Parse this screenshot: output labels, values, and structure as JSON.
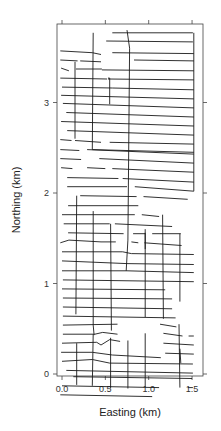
{
  "chart_data": {
    "type": "line",
    "title": "",
    "xlabel": "Easting (km)",
    "ylabel": "Northing (km)",
    "xlim": [
      -0.06,
      1.62
    ],
    "ylim": [
      -0.02,
      3.87
    ],
    "xticks": [
      0.0,
      0.5,
      1.0,
      1.5
    ],
    "xtick_labels": [
      "0.0",
      "0.5",
      "1.0",
      "1.5"
    ],
    "yticks": [
      0,
      1,
      2,
      3
    ],
    "ytick_labels": [
      "0",
      "1",
      "2",
      "3"
    ],
    "grid": false,
    "legend": null,
    "line_color": "#1a1a1a",
    "series": [
      {
        "name": "EW lines",
        "segments": [
          [
            [
              0.58,
              3.77
            ],
            [
              1.51,
              3.77
            ]
          ],
          [
            [
              0.51,
              3.68
            ],
            [
              1.51,
              3.67
            ]
          ],
          [
            [
              -0.02,
              3.57
            ],
            [
              0.35,
              3.55
            ],
            [
              0.45,
              3.53
            ]
          ],
          [
            [
              0.58,
              3.55
            ],
            [
              1.52,
              3.54
            ]
          ],
          [
            [
              -0.02,
              3.47
            ],
            [
              0.18,
              3.46
            ]
          ],
          [
            [
              0.21,
              3.46
            ],
            [
              0.45,
              3.45
            ]
          ],
          [
            [
              0.83,
              3.47
            ],
            [
              1.52,
              3.46
            ]
          ],
          [
            [
              -0.01,
              3.38
            ],
            [
              0.08,
              3.35
            ]
          ],
          [
            [
              0.16,
              3.37
            ],
            [
              0.46,
              3.37
            ]
          ],
          [
            [
              0.46,
              3.36
            ],
            [
              1.52,
              3.35
            ]
          ],
          [
            [
              -0.02,
              3.27
            ],
            [
              0.52,
              3.26
            ]
          ],
          [
            [
              0.53,
              3.26
            ],
            [
              1.52,
              3.25
            ]
          ],
          [
            [
              0.0,
              3.17
            ],
            [
              0.58,
              3.16
            ],
            [
              1.52,
              3.14
            ]
          ],
          [
            [
              -0.01,
              3.08
            ],
            [
              1.52,
              3.04
            ]
          ],
          [
            [
              0.01,
              2.99
            ],
            [
              1.52,
              2.94
            ]
          ],
          [
            [
              0.05,
              2.89
            ],
            [
              1.52,
              2.84
            ]
          ],
          [
            [
              -0.01,
              2.79
            ],
            [
              1.52,
              2.74
            ]
          ],
          [
            [
              0.06,
              2.69
            ],
            [
              1.52,
              2.64
            ]
          ],
          [
            [
              -0.02,
              2.59
            ],
            [
              0.11,
              2.58
            ]
          ],
          [
            [
              0.15,
              2.58
            ],
            [
              0.45,
              2.56
            ]
          ],
          [
            [
              0.55,
              2.56
            ],
            [
              1.52,
              2.54
            ]
          ],
          [
            [
              -0.02,
              2.48
            ],
            [
              0.2,
              2.47
            ]
          ],
          [
            [
              0.29,
              2.48
            ],
            [
              1.52,
              2.43
            ]
          ],
          [
            [
              -0.02,
              2.38
            ],
            [
              0.22,
              2.37
            ]
          ],
          [
            [
              0.43,
              2.38
            ],
            [
              1.52,
              2.33
            ]
          ],
          [
            [
              -0.01,
              2.28
            ],
            [
              0.12,
              2.27
            ]
          ],
          [
            [
              0.29,
              2.28
            ],
            [
              0.5,
              2.27
            ]
          ],
          [
            [
              0.58,
              2.27
            ],
            [
              1.52,
              2.23
            ]
          ],
          [
            [
              0.06,
              2.17
            ],
            [
              0.65,
              2.16
            ]
          ],
          [
            [
              0.7,
              2.16
            ],
            [
              1.52,
              2.12
            ]
          ],
          [
            [
              0.06,
              2.07
            ],
            [
              0.75,
              2.07
            ]
          ],
          [
            [
              0.84,
              2.07
            ],
            [
              1.52,
              2.02
            ]
          ],
          [
            [
              0.21,
              1.97
            ],
            [
              0.86,
              1.96
            ]
          ],
          [
            [
              0.94,
              1.96
            ],
            [
              1.45,
              1.93
            ]
          ],
          [
            [
              0.07,
              1.86
            ],
            [
              0.88,
              1.86
            ]
          ],
          [
            [
              0.0,
              1.76
            ],
            [
              0.84,
              1.76
            ]
          ],
          [
            [
              0.92,
              1.76
            ],
            [
              1.12,
              1.74
            ]
          ],
          [
            [
              0.02,
              1.66
            ],
            [
              0.55,
              1.66
            ]
          ],
          [
            [
              0.61,
              1.66
            ],
            [
              1.27,
              1.63
            ]
          ],
          [
            [
              0.07,
              1.56
            ],
            [
              0.71,
              1.55
            ]
          ],
          [
            [
              0.82,
              1.55
            ],
            [
              0.96,
              1.55
            ]
          ],
          [
            [
              1.04,
              1.55
            ],
            [
              1.37,
              1.55
            ]
          ],
          [
            [
              -0.02,
              1.45
            ],
            [
              0.08,
              1.48
            ],
            [
              0.45,
              1.46
            ],
            [
              0.62,
              1.46
            ]
          ],
          [
            [
              0.8,
              1.46
            ],
            [
              0.88,
              1.45
            ]
          ],
          [
            [
              0.95,
              1.45
            ],
            [
              1.38,
              1.42
            ]
          ],
          [
            [
              0.0,
              1.35
            ],
            [
              0.7,
              1.35
            ],
            [
              0.8,
              1.33
            ],
            [
              1.52,
              1.32
            ]
          ],
          [
            [
              0.0,
              1.25
            ],
            [
              0.75,
              1.22
            ],
            [
              1.52,
              1.21
            ]
          ],
          [
            [
              0.0,
              1.14
            ],
            [
              0.75,
              1.14
            ],
            [
              1.52,
              1.12
            ]
          ],
          [
            [
              0.01,
              1.04
            ],
            [
              1.52,
              1.02
            ]
          ],
          [
            [
              0.0,
              0.94
            ],
            [
              1.19,
              0.93
            ]
          ],
          [
            [
              0.01,
              0.84
            ],
            [
              1.27,
              0.83
            ]
          ],
          [
            [
              0.01,
              0.74
            ],
            [
              1.27,
              0.72
            ]
          ],
          [
            [
              0.01,
              0.64
            ],
            [
              1.31,
              0.62
            ]
          ],
          [
            [
              0.01,
              0.54
            ],
            [
              0.64,
              0.55
            ]
          ],
          [
            [
              1.13,
              0.55
            ],
            [
              1.32,
              0.52
            ]
          ],
          [
            [
              0.01,
              0.44
            ],
            [
              0.38,
              0.44
            ],
            [
              0.47,
              0.46
            ],
            [
              0.64,
              0.44
            ]
          ],
          [
            [
              1.17,
              0.45
            ],
            [
              1.39,
              0.42
            ]
          ],
          [
            [
              1.46,
              0.42
            ],
            [
              1.52,
              0.42
            ]
          ],
          [
            [
              0.0,
              0.34
            ],
            [
              0.4,
              0.35
            ],
            [
              0.45,
              0.32
            ],
            [
              0.55,
              0.38
            ],
            [
              0.67,
              0.36
            ]
          ],
          [
            [
              1.17,
              0.34
            ],
            [
              1.52,
              0.32
            ]
          ],
          [
            [
              -0.01,
              0.24
            ],
            [
              0.35,
              0.24
            ],
            [
              0.58,
              0.21
            ],
            [
              1.14,
              0.18
            ]
          ],
          [
            [
              1.19,
              0.23
            ],
            [
              1.52,
              0.22
            ]
          ],
          [
            [
              0.0,
              0.14
            ],
            [
              0.35,
              0.16
            ],
            [
              0.55,
              0.12
            ],
            [
              1.51,
              0.11
            ]
          ],
          [
            [
              0.05,
              0.04
            ],
            [
              1.51,
              0.01
            ]
          ],
          [
            [
              0.13,
              -0.03
            ],
            [
              1.5,
              -0.05
            ]
          ],
          [
            [
              0.0,
              -0.13
            ],
            [
              1.12,
              -0.15
            ]
          ],
          [
            [
              1.45,
              -0.15
            ],
            [
              1.51,
              -0.15
            ]
          ],
          [
            [
              -0.02,
              -0.23
            ],
            [
              1.04,
              -0.25
            ]
          ]
        ]
      },
      {
        "name": "NS tie lines",
        "segments": [
          [
            [
              0.36,
              3.77
            ],
            [
              0.35,
              2.48
            ]
          ],
          [
            [
              0.75,
              3.8
            ],
            [
              0.78,
              3.6
            ],
            [
              0.76,
              1.48
            ],
            [
              0.74,
              1.14
            ]
          ],
          [
            [
              0.15,
              3.45
            ],
            [
              0.15,
              2.6
            ]
          ],
          [
            [
              0.53,
              3.27
            ],
            [
              0.55,
              3.27
            ],
            [
              0.55,
              2.98
            ]
          ],
          [
            [
              0.35,
              2.48
            ],
            [
              1.52,
              2.45
            ]
          ],
          [
            [
              1.52,
              3.77
            ],
            [
              1.52,
              2.02
            ]
          ],
          [
            [
              0.17,
              1.97
            ],
            [
              0.16,
              0.66
            ]
          ],
          [
            [
              0.36,
              1.8
            ],
            [
              0.36,
              0.54
            ],
            [
              0.37,
              0.43
            ]
          ],
          [
            [
              0.56,
              1.66
            ],
            [
              0.57,
              0.48
            ]
          ],
          [
            [
              0.96,
              1.56
            ],
            [
              0.96,
              1.38
            ]
          ],
          [
            [
              0.96,
              1.6
            ],
            [
              0.96,
              0.63
            ]
          ],
          [
            [
              1.16,
              1.76
            ],
            [
              1.17,
              0.61
            ]
          ],
          [
            [
              1.36,
              1.55
            ],
            [
              1.36,
              0.8
            ]
          ],
          [
            [
              0.17,
              0.34
            ],
            [
              0.17,
              -0.12
            ]
          ],
          [
            [
              0.36,
              0.44
            ],
            [
              0.35,
              -0.13
            ]
          ],
          [
            [
              0.56,
              0.4
            ],
            [
              0.56,
              -0.16
            ]
          ],
          [
            [
              0.76,
              0.37
            ],
            [
              0.76,
              -0.16
            ]
          ],
          [
            [
              0.96,
              0.45
            ],
            [
              0.96,
              -0.14
            ]
          ],
          [
            [
              1.35,
              0.55
            ],
            [
              1.36,
              -0.15
            ]
          ],
          [
            [
              1.36,
              0.28
            ],
            [
              1.37,
              0.12
            ]
          ]
        ]
      }
    ]
  },
  "axes": {
    "xlabel": "Easting (km)",
    "ylabel": "Northing (km)",
    "xticks": [
      {
        "value": 0.0,
        "label": "0.0"
      },
      {
        "value": 0.5,
        "label": "0.5"
      },
      {
        "value": 1.0,
        "label": "1.0"
      },
      {
        "value": 1.5,
        "label": "1.5"
      }
    ],
    "yticks": [
      {
        "value": 0,
        "label": "0"
      },
      {
        "value": 1,
        "label": "1"
      },
      {
        "value": 2,
        "label": "2"
      },
      {
        "value": 3,
        "label": "3"
      }
    ]
  }
}
